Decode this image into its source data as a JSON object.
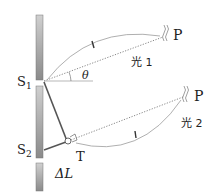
{
  "diagram": {
    "labels": {
      "s1": "S",
      "s1_sub": "1",
      "s2": "S",
      "s2_sub": "2",
      "p_top": "P",
      "p_bottom": "P",
      "light1": "光 1",
      "light2": "光 2",
      "theta": "θ",
      "t": "T",
      "delta_l": "ΔL"
    },
    "colors": {
      "wall": "#a8a8a8",
      "line": "#555555",
      "dotted": "#888888",
      "curve": "#9a9a9a"
    }
  }
}
